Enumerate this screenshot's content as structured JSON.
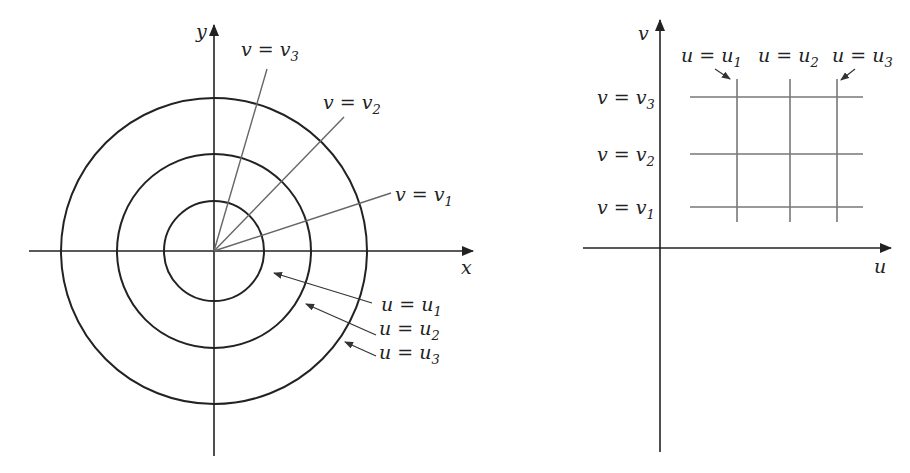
{
  "figure": {
    "left_panel": {
      "name": "xy-plane",
      "x_axis_label": "x",
      "y_axis_label": "y",
      "circles": [
        {
          "label_var": "u",
          "label_eq": " = ",
          "label_val": "u",
          "label_sub": "1"
        },
        {
          "label_var": "u",
          "label_eq": " = ",
          "label_val": "u",
          "label_sub": "2"
        },
        {
          "label_var": "u",
          "label_eq": " = ",
          "label_val": "u",
          "label_sub": "3"
        }
      ],
      "rays": [
        {
          "label_var": "v",
          "label_eq": " = ",
          "label_val": "v",
          "label_sub": "1"
        },
        {
          "label_var": "v",
          "label_eq": " = ",
          "label_val": "v",
          "label_sub": "2"
        },
        {
          "label_var": "v",
          "label_eq": " = ",
          "label_val": "v",
          "label_sub": "3"
        }
      ]
    },
    "right_panel": {
      "name": "uv-plane",
      "x_axis_label": "u",
      "y_axis_label": "v",
      "vertical_lines": [
        {
          "label_var": "u",
          "label_eq": " = ",
          "label_val": "u",
          "label_sub": "1"
        },
        {
          "label_var": "u",
          "label_eq": " = ",
          "label_val": "u",
          "label_sub": "2"
        },
        {
          "label_var": "u",
          "label_eq": " = ",
          "label_val": "u",
          "label_sub": "3"
        }
      ],
      "horizontal_lines": [
        {
          "label_var": "v",
          "label_eq": " = ",
          "label_val": "v",
          "label_sub": "1"
        },
        {
          "label_var": "v",
          "label_eq": " = ",
          "label_val": "v",
          "label_sub": "2"
        },
        {
          "label_var": "v",
          "label_eq": " = ",
          "label_val": "v",
          "label_sub": "3"
        }
      ]
    }
  }
}
